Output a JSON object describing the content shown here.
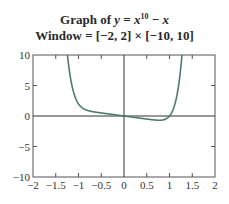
{
  "title": {
    "line1_prefix": "Graph of ",
    "line1_y": "y",
    "line1_eq": " = ",
    "line1_x": "x",
    "line1_exp": "10",
    "line1_minus": " − ",
    "line1_x2": "x",
    "line2": "Window = [−2, 2] × [−10, 10]"
  },
  "colors": {
    "curve": "#4f7a6e",
    "axis": "#333333",
    "frame": "#555555"
  },
  "chart_data": {
    "type": "line",
    "subtitle": "Window = [−2, 2] × [−10, 10]",
    "function": "x^10 - x",
    "xlabel": "",
    "ylabel": "",
    "xlim": [
      -2,
      2
    ],
    "ylim": [
      -10,
      10
    ],
    "grid": false,
    "legend": null,
    "x_ticks": [
      -2,
      -1.5,
      -1,
      -0.5,
      0,
      0.5,
      1,
      1.5,
      2
    ],
    "x_tick_labels": [
      "−2",
      "−1.5",
      "−1",
      "−0.5",
      "0",
      "0.5",
      "1",
      "1.5",
      "2"
    ],
    "y_ticks": [
      -10,
      -5,
      0,
      5,
      10
    ],
    "y_tick_labels": [
      "−10",
      "−5",
      "0",
      "5",
      "10"
    ],
    "series": [
      {
        "name": "y = x^10 − x",
        "x": [
          -1.28,
          -1.25,
          -1.2,
          -1.15,
          -1.1,
          -1.05,
          -1.0,
          -0.9,
          -0.8,
          -0.6,
          -0.4,
          -0.2,
          0,
          0.2,
          0.4,
          0.6,
          0.7,
          0.8,
          0.9,
          1.0,
          1.05,
          1.1,
          1.15,
          1.2,
          1.25,
          1.27
        ],
        "values": [
          13.1,
          10.56,
          7.39,
          5.2,
          3.69,
          2.68,
          2.0,
          1.25,
          0.91,
          0.61,
          0.4,
          0.2,
          0,
          -0.2,
          -0.4,
          -0.59,
          -0.67,
          -0.69,
          -0.55,
          0.0,
          0.58,
          1.49,
          2.9,
          5.0,
          8.06,
          9.67
        ]
      }
    ]
  }
}
